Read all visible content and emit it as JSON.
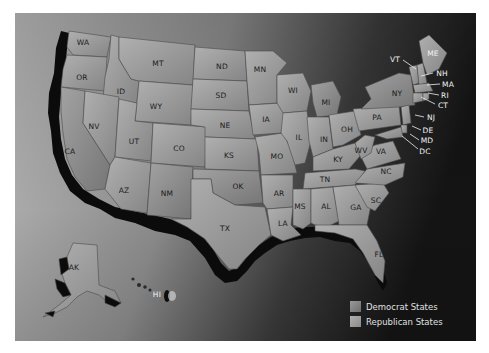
{
  "map": {
    "title": "United States",
    "colors": {
      "background_light": "#b4b4b4",
      "background_dark": "#161616",
      "state_fill": "#9a9a9a",
      "state_stroke": "#555555",
      "coast_shadow": "#0a0a0a",
      "democrat_swatch": "#8c8c8c",
      "republican_swatch": "#9e9e9e"
    },
    "states": [
      {
        "abbr": "WA",
        "x": 68,
        "y": 29
      },
      {
        "abbr": "OR",
        "x": 67,
        "y": 64
      },
      {
        "abbr": "ID",
        "x": 106,
        "y": 78
      },
      {
        "abbr": "MT",
        "x": 143,
        "y": 50
      },
      {
        "abbr": "WY",
        "x": 141,
        "y": 93
      },
      {
        "abbr": "NV",
        "x": 79,
        "y": 113
      },
      {
        "abbr": "UT",
        "x": 119,
        "y": 128
      },
      {
        "abbr": "CO",
        "x": 164,
        "y": 135
      },
      {
        "abbr": "CA",
        "x": 55,
        "y": 138
      },
      {
        "abbr": "AZ",
        "x": 109,
        "y": 177
      },
      {
        "abbr": "NM",
        "x": 152,
        "y": 180
      },
      {
        "abbr": "ND",
        "x": 207,
        "y": 53
      },
      {
        "abbr": "SD",
        "x": 206,
        "y": 82
      },
      {
        "abbr": "NE",
        "x": 210,
        "y": 112
      },
      {
        "abbr": "KS",
        "x": 214,
        "y": 142
      },
      {
        "abbr": "OK",
        "x": 223,
        "y": 173
      },
      {
        "abbr": "TX",
        "x": 210,
        "y": 215
      },
      {
        "abbr": "MN",
        "x": 245,
        "y": 56
      },
      {
        "abbr": "IA",
        "x": 251,
        "y": 106
      },
      {
        "abbr": "MO",
        "x": 262,
        "y": 143
      },
      {
        "abbr": "AR",
        "x": 264,
        "y": 180
      },
      {
        "abbr": "LA",
        "x": 268,
        "y": 210
      },
      {
        "abbr": "WI",
        "x": 278,
        "y": 77
      },
      {
        "abbr": "IL",
        "x": 284,
        "y": 124
      },
      {
        "abbr": "MI",
        "x": 311,
        "y": 89
      },
      {
        "abbr": "IN",
        "x": 309,
        "y": 126
      },
      {
        "abbr": "OH",
        "x": 332,
        "y": 116
      },
      {
        "abbr": "KY",
        "x": 323,
        "y": 146
      },
      {
        "abbr": "TN",
        "x": 310,
        "y": 166
      },
      {
        "abbr": "MS",
        "x": 285,
        "y": 193
      },
      {
        "abbr": "AL",
        "x": 311,
        "y": 193
      },
      {
        "abbr": "GA",
        "x": 341,
        "y": 194
      },
      {
        "abbr": "FL",
        "x": 364,
        "y": 241
      },
      {
        "abbr": "SC",
        "x": 361,
        "y": 187
      },
      {
        "abbr": "NC",
        "x": 371,
        "y": 158
      },
      {
        "abbr": "VA",
        "x": 366,
        "y": 138
      },
      {
        "abbr": "WV",
        "x": 346,
        "y": 137
      },
      {
        "abbr": "PA",
        "x": 362,
        "y": 104
      },
      {
        "abbr": "NY",
        "x": 382,
        "y": 80
      },
      {
        "abbr": "AK",
        "x": 59,
        "y": 254
      },
      {
        "abbr": "HI",
        "x": 142,
        "y": 281,
        "light": true
      }
    ],
    "callouts": [
      {
        "abbr": "VT",
        "x": 380,
        "y": 46,
        "lx1": 388,
        "ly1": 47,
        "lx2": 401,
        "ly2": 56
      },
      {
        "abbr": "ME",
        "x": 418,
        "y": 40
      },
      {
        "abbr": "NH",
        "x": 427,
        "y": 60,
        "lx1": 406,
        "ly1": 63,
        "lx2": 418,
        "ly2": 60
      },
      {
        "abbr": "MA",
        "x": 433,
        "y": 71,
        "lx1": 412,
        "ly1": 72,
        "lx2": 425,
        "ly2": 71
      },
      {
        "abbr": "RI",
        "x": 430,
        "y": 82,
        "lx1": 413,
        "ly1": 80,
        "lx2": 424,
        "ly2": 82
      },
      {
        "abbr": "CT",
        "x": 428,
        "y": 92,
        "lx1": 406,
        "ly1": 84,
        "lx2": 420,
        "ly2": 91
      },
      {
        "abbr": "NJ",
        "x": 416,
        "y": 104,
        "lx1": 400,
        "ly1": 102,
        "lx2": 409,
        "ly2": 104
      },
      {
        "abbr": "DE",
        "x": 413,
        "y": 117,
        "lx1": 397,
        "ly1": 113,
        "lx2": 406,
        "ly2": 117
      },
      {
        "abbr": "MD",
        "x": 412,
        "y": 127,
        "lx1": 395,
        "ly1": 121,
        "lx2": 404,
        "ly2": 127
      },
      {
        "abbr": "DC",
        "x": 410,
        "y": 138,
        "lx1": 387,
        "ly1": 123,
        "lx2": 403,
        "ly2": 136
      }
    ]
  },
  "legend": {
    "items": [
      {
        "label": "Democrat States",
        "color": "#8c8c8c"
      },
      {
        "label": "Republican States",
        "color": "#a0a0a0"
      }
    ]
  }
}
